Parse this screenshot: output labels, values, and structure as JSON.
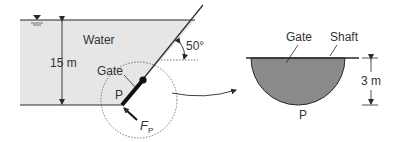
{
  "figure": {
    "left_view": {
      "fluid_label": "Water",
      "depth_label": "15 m",
      "gate_label": "Gate",
      "point_label": "P",
      "force_label": "F",
      "force_subscript": "P",
      "angle_label": "50°"
    },
    "right_view": {
      "gate_label": "Gate",
      "shaft_label": "Shaft",
      "radius_label": "3 m",
      "point_label": "P"
    },
    "colors": {
      "water_fill": "#e6e6e6",
      "gate_fill": "#8a8a8a",
      "line": "#2a2a2a",
      "text": "#333333"
    }
  }
}
